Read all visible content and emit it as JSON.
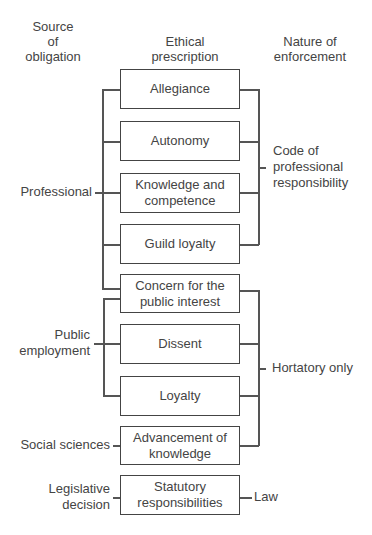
{
  "headers": {
    "source": [
      "Source",
      "of",
      "obligation"
    ],
    "prescription": [
      "Ethical",
      "prescription"
    ],
    "enforcement": [
      "Nature of",
      "enforcement"
    ]
  },
  "boxes": [
    {
      "line1": "Allegiance",
      "line2": ""
    },
    {
      "line1": "Autonomy",
      "line2": ""
    },
    {
      "line1": "Knowledge and",
      "line2": "competence"
    },
    {
      "line1": "Guild loyalty",
      "line2": ""
    },
    {
      "line1": "Concern for the",
      "line2": "public interest"
    },
    {
      "line1": "Dissent",
      "line2": ""
    },
    {
      "line1": "Loyalty",
      "line2": ""
    },
    {
      "line1": "Advancement of",
      "line2": "knowledge"
    },
    {
      "line1": "Statutory",
      "line2": "responsibilities"
    }
  ],
  "sources": {
    "professional": "Professional",
    "public_employment": [
      "Public",
      "employment"
    ],
    "social_sciences": "Social sciences",
    "legislative": [
      "Legislative",
      "decision"
    ]
  },
  "enforcement": {
    "code": [
      "Code of",
      "professional",
      "responsibility"
    ],
    "hortatory": "Hortatory only",
    "law": "Law"
  }
}
